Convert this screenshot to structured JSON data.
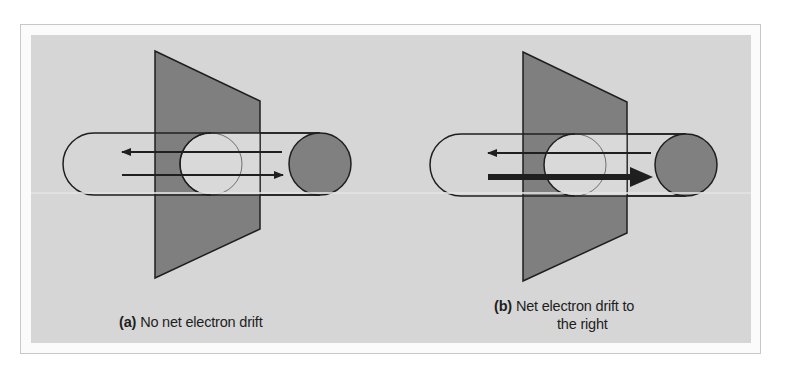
{
  "figure": {
    "colors": {
      "background": "#d6d6d6",
      "plate": "#7f7f7f",
      "end_disc": "#808080",
      "stroke": "#1f1f1f",
      "frame": "#c8c8c8"
    },
    "panels": [
      {
        "id": "a",
        "label": "(a)",
        "caption": "No net electron drift",
        "arrows": [
          {
            "direction": "left",
            "weight": "thin"
          },
          {
            "direction": "right",
            "weight": "thin"
          }
        ]
      },
      {
        "id": "b",
        "label": "(b)",
        "caption_line1": "Net electron drift to",
        "caption_line2": "the right",
        "arrows": [
          {
            "direction": "left",
            "weight": "thin"
          },
          {
            "direction": "right",
            "weight": "thick"
          }
        ]
      }
    ]
  }
}
